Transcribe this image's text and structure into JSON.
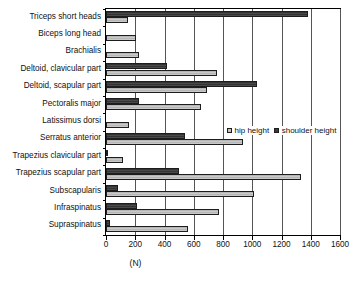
{
  "chart_data": {
    "type": "bar",
    "orientation": "horizontal",
    "title": "",
    "xlabel": "(N)",
    "ylabel": "",
    "xlim": [
      0,
      1600
    ],
    "xticks": [
      0,
      200,
      400,
      600,
      800,
      1000,
      1200,
      1400,
      1600
    ],
    "grid": true,
    "legend_position": "middle-right",
    "categories": [
      "Triceps short heads",
      "Biceps long head",
      "Brachialis",
      "Deltoid, clavicular part",
      "Deltoid, scapular part",
      "Pectoralis major",
      "Latissimus dorsi",
      "Serratus anterior",
      "Trapezius clavicular part",
      "Trapezius scapular part",
      "Subscapularis",
      "Infraspinatus",
      "Supraspinatus"
    ],
    "series": [
      {
        "name": "hip height",
        "color": "#c2c2c2",
        "values": [
          150,
          205,
          225,
          760,
          690,
          650,
          155,
          940,
          115,
          1330,
          1010,
          770,
          560
        ]
      },
      {
        "name": "shoulder height",
        "color": "#3b3b3b",
        "values": [
          1380,
          0,
          0,
          420,
          1030,
          225,
          0,
          540,
          15,
          500,
          80,
          210,
          25
        ]
      }
    ]
  },
  "legend": {
    "items": [
      {
        "label": "hip height"
      },
      {
        "label": "shoulder height"
      }
    ]
  },
  "axis": {
    "x_title": "(N)",
    "tick_labels": [
      "0",
      "200",
      "400",
      "600",
      "800",
      "1000",
      "1200",
      "1400",
      "1600"
    ]
  }
}
